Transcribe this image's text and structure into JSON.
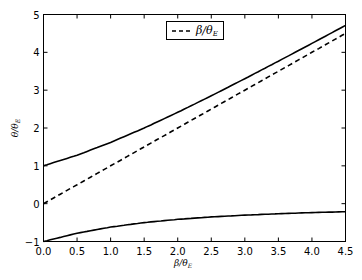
{
  "chart_data": {
    "type": "line",
    "title": "",
    "xlabel": "β/θ_E",
    "ylabel": "θ/θ_E",
    "xlim": [
      0.0,
      4.5
    ],
    "ylim": [
      -1,
      5
    ],
    "grid": false,
    "legend_position": "upper center",
    "x_ticks": [
      "0.0",
      "0.5",
      "1.0",
      "1.5",
      "2.0",
      "2.5",
      "3.0",
      "3.5",
      "4.0",
      "4.5"
    ],
    "y_ticks": [
      "−1",
      "0",
      "1",
      "2",
      "3",
      "4",
      "5"
    ],
    "x": [
      0.0,
      0.5,
      1.0,
      1.5,
      2.0,
      2.5,
      3.0,
      3.5,
      4.0,
      4.5
    ],
    "series": [
      {
        "name": "θ+ (upper image)",
        "style": "solid",
        "in_legend": false,
        "values": [
          1.0,
          1.281,
          1.618,
          2.0,
          2.414,
          2.851,
          3.303,
          3.766,
          4.236,
          4.712
        ]
      },
      {
        "name": "β/θ_E",
        "style": "dashed",
        "in_legend": true,
        "values": [
          0.0,
          0.5,
          1.0,
          1.5,
          2.0,
          2.5,
          3.0,
          3.5,
          4.0,
          4.5
        ]
      },
      {
        "name": "θ− (lower image)",
        "style": "solid",
        "in_legend": false,
        "values": [
          -1.0,
          -0.781,
          -0.618,
          -0.5,
          -0.414,
          -0.351,
          -0.303,
          -0.266,
          -0.236,
          -0.212
        ]
      }
    ]
  },
  "legend": {
    "entry_label_main": "β/θ",
    "entry_label_sub": "E"
  },
  "axes": {
    "xlabel_main": "β/θ",
    "xlabel_sub": "E",
    "ylabel_main": "θ/θ",
    "ylabel_sub": "E"
  },
  "colors": {
    "line": "#000000",
    "axis": "#000000",
    "background": "#ffffff"
  }
}
